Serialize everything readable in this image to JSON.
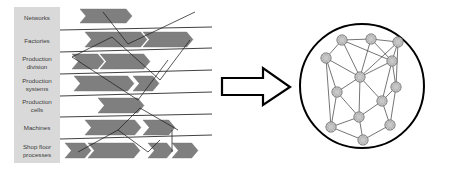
{
  "figure": {
    "background_color": "#ffffff",
    "width": 450,
    "height": 171
  },
  "left_panel": {
    "name": "hierarchy-levels-diagram",
    "label_column": {
      "x": 14,
      "width": 46,
      "fill": "#d9d9d9",
      "text_color": "#3a3a3a"
    },
    "rows": [
      {
        "id": "networks",
        "label": "Networks",
        "lines": [
          "Networks"
        ],
        "y": 7,
        "height": 23
      },
      {
        "id": "factories",
        "label": "Factories",
        "lines": [
          "Factories"
        ],
        "y": 30,
        "height": 22
      },
      {
        "id": "production-division",
        "label": "Production division",
        "lines": [
          "Production",
          "division"
        ],
        "y": 52,
        "height": 22
      },
      {
        "id": "production-systems",
        "label": "Production systems",
        "lines": [
          "Production",
          "systems"
        ],
        "y": 74,
        "height": 22
      },
      {
        "id": "production-cells",
        "label": "Production cells",
        "lines": [
          "Production",
          "cells"
        ],
        "y": 96,
        "height": 21
      },
      {
        "id": "machines",
        "label": "Machines",
        "lines": [
          "Machines"
        ],
        "y": 117,
        "height": 22
      },
      {
        "id": "shop-floor-processes",
        "label": "Shop floor processes",
        "lines": [
          "Shop floor",
          "processes"
        ],
        "y": 139,
        "height": 24
      }
    ],
    "separator_lines": [
      {
        "x1": 60,
        "y1": 30,
        "x2": 212,
        "y2": 27
      },
      {
        "x1": 60,
        "y1": 52,
        "x2": 212,
        "y2": 48
      },
      {
        "x1": 60,
        "y1": 74,
        "x2": 212,
        "y2": 70
      },
      {
        "x1": 60,
        "y1": 96,
        "x2": 212,
        "y2": 92
      },
      {
        "x1": 60,
        "y1": 117,
        "x2": 212,
        "y2": 114
      },
      {
        "x1": 60,
        "y1": 139,
        "x2": 212,
        "y2": 135
      }
    ],
    "connector_lines": [
      {
        "x1": 103,
        "y1": 12,
        "x2": 128,
        "y2": 44
      },
      {
        "x1": 128,
        "y1": 44,
        "x2": 195,
        "y2": 12
      },
      {
        "x1": 72,
        "y1": 57,
        "x2": 112,
        "y2": 37
      },
      {
        "x1": 112,
        "y1": 37,
        "x2": 160,
        "y2": 80
      },
      {
        "x1": 160,
        "y1": 80,
        "x2": 190,
        "y2": 40
      },
      {
        "x1": 72,
        "y1": 57,
        "x2": 138,
        "y2": 100
      },
      {
        "x1": 138,
        "y1": 100,
        "x2": 168,
        "y2": 60
      },
      {
        "x1": 118,
        "y1": 130,
        "x2": 140,
        "y2": 108
      },
      {
        "x1": 140,
        "y1": 108,
        "x2": 178,
        "y2": 130
      },
      {
        "x1": 78,
        "y1": 152,
        "x2": 118,
        "y2": 130
      },
      {
        "x1": 118,
        "y1": 130,
        "x2": 148,
        "y2": 152
      },
      {
        "x1": 148,
        "y1": 152,
        "x2": 160,
        "y2": 140
      },
      {
        "x1": 172,
        "y1": 152,
        "x2": 172,
        "y2": 130
      }
    ],
    "chevron_fill": "#7f7f7f",
    "chevrons": [
      {
        "row": "networks",
        "x": 80,
        "y": 9,
        "w": 52,
        "h": 14
      },
      {
        "row": "factories",
        "x": 85,
        "y": 32,
        "w": 62,
        "h": 15
      },
      {
        "row": "factories",
        "x": 143,
        "y": 32,
        "w": 50,
        "h": 15
      },
      {
        "row": "production-division",
        "x": 72,
        "y": 54,
        "w": 32,
        "h": 15
      },
      {
        "row": "production-division",
        "x": 100,
        "y": 54,
        "w": 50,
        "h": 15
      },
      {
        "row": "production-systems",
        "x": 74,
        "y": 76,
        "w": 60,
        "h": 15
      },
      {
        "row": "production-systems",
        "x": 133,
        "y": 76,
        "w": 26,
        "h": 15
      },
      {
        "row": "production-cells",
        "x": 98,
        "y": 98,
        "w": 46,
        "h": 15
      },
      {
        "row": "machines",
        "x": 85,
        "y": 120,
        "w": 56,
        "h": 15
      },
      {
        "row": "machines",
        "x": 143,
        "y": 120,
        "w": 32,
        "h": 15
      },
      {
        "row": "shop-floor-processes",
        "x": 65,
        "y": 143,
        "w": 26,
        "h": 15
      },
      {
        "row": "shop-floor-processes",
        "x": 88,
        "y": 143,
        "w": 52,
        "h": 15
      },
      {
        "row": "shop-floor-processes",
        "x": 148,
        "y": 143,
        "w": 25,
        "h": 15
      },
      {
        "row": "shop-floor-processes",
        "x": 172,
        "y": 143,
        "w": 26,
        "h": 15
      }
    ]
  },
  "transform_arrow": {
    "name": "transformation-arrow",
    "fill": "#ffffff",
    "stroke": "#000000",
    "points": "222,78 263,78 263,68 290,87 263,105 263,95 222,95"
  },
  "right_panel": {
    "name": "network-graph-diagram",
    "circle": {
      "cx": 362,
      "cy": 86,
      "r": 62,
      "stroke": "#000000",
      "stroke_width": 2,
      "fill": "#ffffff"
    },
    "node_fill": "#c8c8c8",
    "node_stroke": "#555555",
    "node_radius": 5.2,
    "edge_color": "#3a3a3a",
    "nodes": [
      {
        "id": "n1",
        "x": 342,
        "y": 40
      },
      {
        "id": "n2",
        "x": 371,
        "y": 39
      },
      {
        "id": "n3",
        "x": 398,
        "y": 42
      },
      {
        "id": "n4",
        "x": 326,
        "y": 58
      },
      {
        "id": "n5",
        "x": 392,
        "y": 61
      },
      {
        "id": "n6",
        "x": 360,
        "y": 77
      },
      {
        "id": "n7",
        "x": 337,
        "y": 92
      },
      {
        "id": "n8",
        "x": 396,
        "y": 87
      },
      {
        "id": "n9",
        "x": 382,
        "y": 101
      },
      {
        "id": "n10",
        "x": 359,
        "y": 117
      },
      {
        "id": "n11",
        "x": 331,
        "y": 127
      },
      {
        "id": "n12",
        "x": 390,
        "y": 125
      },
      {
        "id": "n13",
        "x": 363,
        "y": 140
      }
    ],
    "edges": [
      [
        "n1",
        "n2"
      ],
      [
        "n2",
        "n3"
      ],
      [
        "n1",
        "n4"
      ],
      [
        "n1",
        "n6"
      ],
      [
        "n1",
        "n5"
      ],
      [
        "n2",
        "n6"
      ],
      [
        "n3",
        "n5"
      ],
      [
        "n3",
        "n6"
      ],
      [
        "n4",
        "n6"
      ],
      [
        "n4",
        "n7"
      ],
      [
        "n4",
        "n11"
      ],
      [
        "n5",
        "n6"
      ],
      [
        "n5",
        "n8"
      ],
      [
        "n5",
        "n9"
      ],
      [
        "n6",
        "n7"
      ],
      [
        "n6",
        "n9"
      ],
      [
        "n6",
        "n10"
      ],
      [
        "n7",
        "n10"
      ],
      [
        "n7",
        "n11"
      ],
      [
        "n8",
        "n9"
      ],
      [
        "n8",
        "n12"
      ],
      [
        "n9",
        "n10"
      ],
      [
        "n9",
        "n12"
      ],
      [
        "n10",
        "n11"
      ],
      [
        "n10",
        "n13"
      ],
      [
        "n11",
        "n13"
      ],
      [
        "n12",
        "n13"
      ],
      [
        "n3",
        "n8"
      ],
      [
        "n2",
        "n5"
      ]
    ]
  }
}
